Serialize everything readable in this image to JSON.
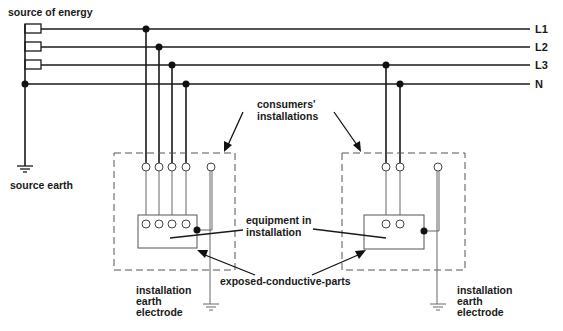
{
  "labels": {
    "source_of_energy": "source of energy",
    "source_earth": "source earth",
    "consumers_installations_line1": "consumers'",
    "consumers_installations_line2": "installations",
    "equipment_line1": "equipment in",
    "equipment_line2": "installation",
    "exposed_parts": "exposed-conductive-parts",
    "electrode_left_line1": "installation",
    "electrode_left_line2": "earth",
    "electrode_left_line3": "electrode",
    "electrode_right_line1": "installation",
    "electrode_right_line2": "earth",
    "electrode_right_line3": "electrode"
  },
  "conductors": [
    {
      "id": "L1",
      "label": "L1"
    },
    {
      "id": "L2",
      "label": "L2"
    },
    {
      "id": "L3",
      "label": "L3"
    },
    {
      "id": "N",
      "label": "N"
    }
  ],
  "colors": {
    "line": "#1a1a1a",
    "dashed_box": "#555555",
    "background": "#ffffff"
  }
}
